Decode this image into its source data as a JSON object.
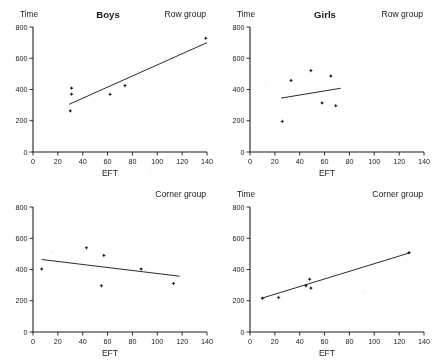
{
  "figure": {
    "axis_label_x": "EFT",
    "axis_label_y": "Time",
    "x_ticks": [
      "0",
      "20",
      "40",
      "60",
      "80",
      "100",
      "120",
      "140"
    ],
    "y_ticks": [
      "0",
      "200",
      "400",
      "600",
      "800"
    ],
    "ink_color": "#1a1a1a",
    "background_color": "#ffffff"
  },
  "panels": [
    {
      "id": "boys-row-group",
      "title": "Boys",
      "group_label": "Row group",
      "y_axis_title": "Time",
      "x_axis_title": "EFT"
    },
    {
      "id": "girls-row-group",
      "title": "Girls",
      "group_label": "Row group",
      "y_axis_title": "Time",
      "x_axis_title": "EFT"
    },
    {
      "id": "boys-corner-group",
      "title": "",
      "group_label": "Corner group",
      "y_axis_title": "",
      "x_axis_title": "EFT"
    },
    {
      "id": "girls-corner-group",
      "title": "",
      "group_label": "Corner group",
      "y_axis_title": "Time",
      "x_axis_title": "EFT"
    }
  ],
  "chart_data": [
    {
      "type": "scatter",
      "title": "Boys",
      "annotation": "Row group",
      "xlabel": "EFT",
      "ylabel": "Time",
      "xlim": [
        0,
        140
      ],
      "ylim": [
        0,
        800
      ],
      "xticks": [
        0,
        20,
        40,
        60,
        80,
        100,
        120,
        140
      ],
      "yticks": [
        0,
        200,
        400,
        600,
        800
      ],
      "grid": false,
      "legend": "none",
      "points": [
        {
          "x": 30,
          "y": 263
        },
        {
          "x": 31,
          "y": 370
        },
        {
          "x": 31,
          "y": 409
        },
        {
          "x": 62,
          "y": 369
        },
        {
          "x": 74,
          "y": 425
        },
        {
          "x": 139,
          "y": 728
        }
      ],
      "fit_line": {
        "x": [
          29,
          140
        ],
        "y": [
          305,
          700
        ]
      }
    },
    {
      "type": "scatter",
      "title": "Girls",
      "annotation": "Row group",
      "xlabel": "EFT",
      "ylabel": "Time",
      "xlim": [
        0,
        140
      ],
      "ylim": [
        0,
        800
      ],
      "xticks": [
        0,
        20,
        40,
        60,
        80,
        100,
        120,
        140
      ],
      "yticks": [
        0,
        200,
        400,
        600,
        800
      ],
      "grid": false,
      "legend": "none",
      "points": [
        {
          "x": 26,
          "y": 196
        },
        {
          "x": 33,
          "y": 458
        },
        {
          "x": 49,
          "y": 521
        },
        {
          "x": 58,
          "y": 314
        },
        {
          "x": 65,
          "y": 486
        },
        {
          "x": 69,
          "y": 296
        }
      ],
      "fit_line": {
        "x": [
          25,
          73
        ],
        "y": [
          345,
          408
        ]
      }
    },
    {
      "type": "scatter",
      "title": "",
      "annotation": "Corner group",
      "xlabel": "EFT",
      "ylabel": "",
      "xlim": [
        0,
        140
      ],
      "ylim": [
        0,
        800
      ],
      "xticks": [
        0,
        20,
        40,
        60,
        80,
        100,
        120,
        140
      ],
      "yticks": [
        0,
        200,
        400,
        600,
        800
      ],
      "grid": false,
      "legend": "none",
      "points": [
        {
          "x": 7,
          "y": 403
        },
        {
          "x": 43,
          "y": 539
        },
        {
          "x": 55,
          "y": 296
        },
        {
          "x": 57,
          "y": 490
        },
        {
          "x": 87,
          "y": 403
        },
        {
          "x": 113,
          "y": 311
        }
      ],
      "fit_line": {
        "x": [
          7,
          118
        ],
        "y": [
          464,
          357
        ]
      }
    },
    {
      "type": "scatter",
      "title": "",
      "annotation": "Corner group",
      "xlabel": "EFT",
      "ylabel": "Time",
      "xlim": [
        0,
        140
      ],
      "ylim": [
        0,
        800
      ],
      "xticks": [
        0,
        20,
        40,
        60,
        80,
        100,
        120,
        140
      ],
      "yticks": [
        0,
        200,
        400,
        600,
        800
      ],
      "grid": false,
      "legend": "none",
      "points": [
        {
          "x": 10,
          "y": 216
        },
        {
          "x": 23,
          "y": 221
        },
        {
          "x": 45,
          "y": 296
        },
        {
          "x": 48,
          "y": 338
        },
        {
          "x": 49,
          "y": 281
        },
        {
          "x": 128,
          "y": 508
        }
      ],
      "fit_line": {
        "x": [
          9,
          129
        ],
        "y": [
          215,
          508
        ]
      }
    }
  ]
}
